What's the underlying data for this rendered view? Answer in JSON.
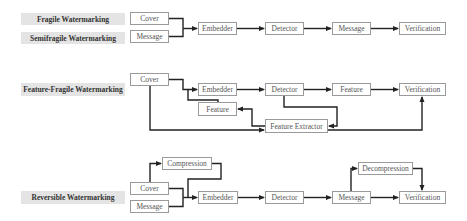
{
  "diagram": {
    "rows": [
      {
        "labels": [
          "Fragile Watermarking",
          "Semifragile Watermarking"
        ],
        "nodes": {
          "cover": "Cover",
          "message_in": "Message",
          "embedder": "Embedder",
          "detector": "Detector",
          "message_out": "Message",
          "verification": "Verification"
        }
      },
      {
        "labels": [
          "Feature-Fragile Watermarking"
        ],
        "nodes": {
          "cover": "Cover",
          "embedder": "Embedder",
          "feature_in": "Feature",
          "detector": "Detector",
          "feature_out": "Feature",
          "verification": "Verification",
          "feature_extractor": "Feature Extractor"
        }
      },
      {
        "labels": [
          "Reversible Watermarking"
        ],
        "nodes": {
          "compression": "Compression",
          "cover": "Cover",
          "message_in": "Message",
          "embedder": "Embedder",
          "detector": "Detector",
          "message_out": "Message",
          "decompression": "Decompression",
          "verification": "Verification"
        }
      }
    ],
    "colors": {
      "label_bg": "#e4e4e4",
      "box_border": "#9a9a9a",
      "arrow": "#222222"
    }
  }
}
